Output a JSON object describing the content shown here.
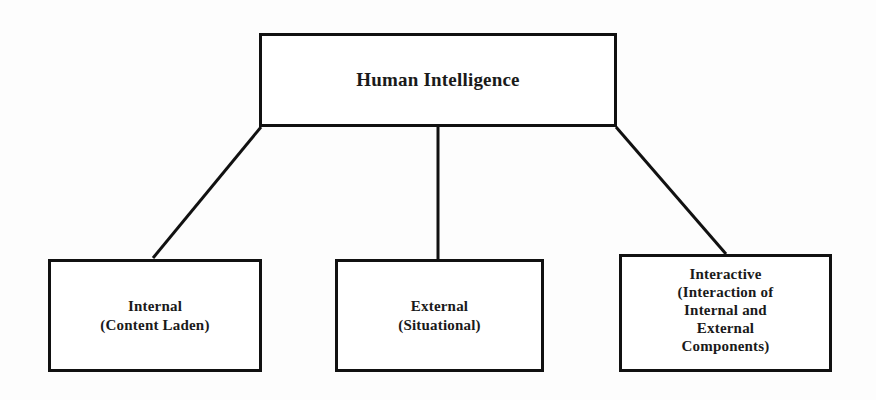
{
  "diagram": {
    "title": "Human Intelligence",
    "background_color": "#fdfdfd",
    "line_color": "#111111",
    "text_color": "#1a1a1a",
    "root": {
      "id": "root",
      "lines": [
        "Human Intelligence"
      ]
    },
    "children": [
      {
        "id": "internal",
        "lines": [
          "Internal",
          "(Content Laden)"
        ]
      },
      {
        "id": "external",
        "lines": [
          "External",
          "(Situational)"
        ]
      },
      {
        "id": "interactive",
        "lines": [
          "Interactive",
          "(Interaction of",
          "Internal and",
          "External",
          "Components)"
        ]
      }
    ]
  }
}
